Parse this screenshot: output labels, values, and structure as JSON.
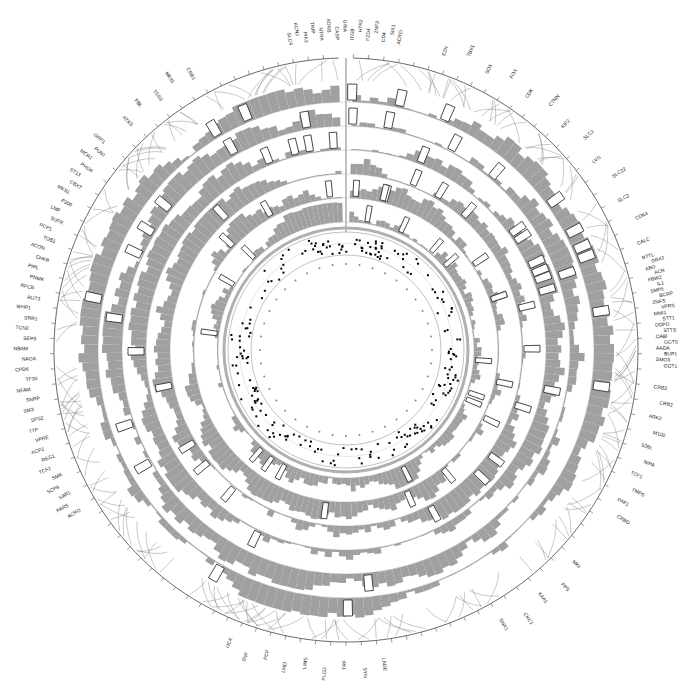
{
  "chart_data": {
    "type": "circular_genome_plot",
    "title": "",
    "center": [
      346,
      350
    ],
    "tracks": {
      "inner_ticks": {
        "count": 40,
        "radius": 92,
        "description": "small tick marks around inner white circle"
      },
      "scatter_track": {
        "inner_radius": 95,
        "outer_radius": 118,
        "marker_color": "#000000"
      },
      "bar_rings": 6,
      "ring_radii": [
        [
          128,
          148
        ],
        [
          152,
          172
        ],
        [
          176,
          196
        ],
        [
          200,
          220
        ],
        [
          224,
          244
        ],
        [
          248,
          268
        ]
      ],
      "bar_color": "#a0a0a0",
      "highlight_box_color": "#333333",
      "outer_axis_radius": 292,
      "label_radius": 310
    },
    "gene_labels": {
      "top": [
        "SLC4",
        "KCNJ",
        "PIK3",
        "TIMP",
        "NTRK",
        "ADRB",
        "CASP",
        "GRIA",
        "ITGB",
        "HTR2",
        "FZD4",
        "ZNF3",
        "CD4",
        "SIX1",
        "ACRO"
      ],
      "top_right": [
        "EZH",
        "TBX1",
        "SOX",
        "FOX",
        "CDK",
        "CTNN",
        "KIF2",
        "SLC2",
        "LVI1",
        "SLC22",
        "SLC2",
        "CDK4",
        "CALC"
      ],
      "right": [
        "RTTL",
        "GRAT",
        "ABO",
        "ACR",
        "FBW2",
        "IL1",
        "SMP5",
        "BCRP",
        "ZNFS",
        "VPRS",
        "MMI1",
        "STT1",
        "DOPD",
        "STTS",
        "CABI",
        "GGTS",
        "AADA",
        "BUP1",
        "SMO3",
        "GGT1"
      ],
      "right_lower": [
        "CRB3",
        "CRB2",
        "ARK2",
        "M100",
        "S26L",
        "NIPA",
        "TCF1",
        "TMPS",
        "PAF1",
        "CRBD"
      ],
      "bottom_right": [
        "MKI",
        "PPS",
        "KAA1",
        "CKC1",
        "SNX1"
      ],
      "bottom": [
        "LAGE",
        "SYN",
        "TRF",
        "PLCD",
        "LIMS",
        "LMO",
        "PCP",
        "SNF",
        "UCK"
      ],
      "left": [
        "ACRO",
        "PARS",
        "SAR1",
        "SCP8",
        "SMA",
        "TCF2",
        "REG1",
        "ACP2",
        "VPRE",
        "TTP",
        "SPS2",
        "SM3",
        "SNRP",
        "NFAM",
        "TF30",
        "CPD6",
        "NAGA",
        "NBAM",
        "SEP3",
        "TCN2",
        "SRR1",
        "WHP1",
        "RUT3",
        "RPCB",
        "PNMK",
        "PIPL",
        "CHKB",
        "ACON",
        "TOB1",
        "PCP1",
        "SUFR",
        "LMF",
        "P300",
        "MKS1",
        "CBXT",
        "ST13",
        "PHOX",
        "MCR1",
        "PU60",
        "GRP1"
      ],
      "top_left": [
        "ATXS",
        "FBL",
        "TSSS",
        "MEIG",
        "CRB1"
      ]
    },
    "legend": null,
    "grid": false
  }
}
